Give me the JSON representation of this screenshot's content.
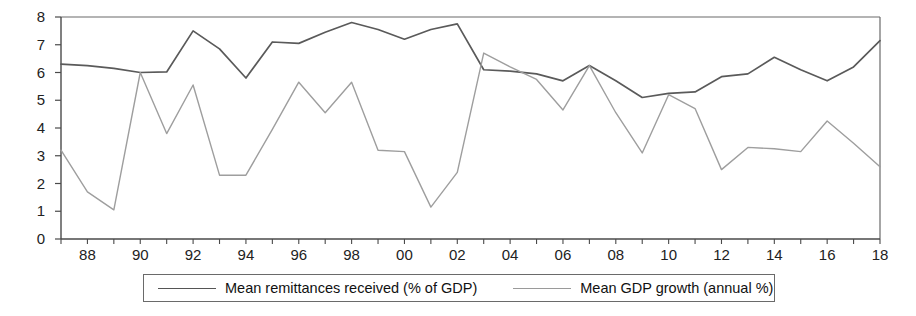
{
  "chart_data": {
    "type": "line",
    "title": "",
    "subtitle": "",
    "xlabel": "",
    "ylabel": "",
    "xlim": [
      1987,
      2018
    ],
    "ylim": [
      0,
      8
    ],
    "grid": false,
    "legend_position": "bottom",
    "x": [
      1987,
      1988,
      1989,
      1990,
      1991,
      1992,
      1993,
      1994,
      1995,
      1996,
      1997,
      1998,
      1999,
      2000,
      2001,
      2002,
      2003,
      2004,
      2005,
      2006,
      2007,
      2008,
      2009,
      2010,
      2011,
      2012,
      2013,
      2014,
      2015,
      2016,
      2017,
      2018
    ],
    "x_tick_labels": [
      "88",
      "90",
      "92",
      "94",
      "96",
      "98",
      "00",
      "02",
      "04",
      "06",
      "08",
      "10",
      "12",
      "14",
      "16",
      "18"
    ],
    "x_tick_values": [
      1988,
      1990,
      1992,
      1994,
      1996,
      1998,
      2000,
      2002,
      2004,
      2006,
      2008,
      2010,
      2012,
      2014,
      2016,
      2018
    ],
    "y_tick_labels": [
      "0",
      "1",
      "2",
      "3",
      "4",
      "5",
      "6",
      "7",
      "8"
    ],
    "y_tick_values": [
      0,
      1,
      2,
      3,
      4,
      5,
      6,
      7,
      8
    ],
    "series": [
      {
        "name": "Mean remittances received (% of GDP)",
        "color": "#5a5a5a",
        "values": [
          6.3,
          6.25,
          6.15,
          6.0,
          6.02,
          7.5,
          6.85,
          5.8,
          7.1,
          7.05,
          7.45,
          7.8,
          7.55,
          7.2,
          7.55,
          7.75,
          6.1,
          6.05,
          5.95,
          5.7,
          6.25,
          5.7,
          5.1,
          5.25,
          5.3,
          5.85,
          5.95,
          6.55,
          6.1,
          5.7,
          6.2,
          7.15
        ]
      },
      {
        "name": "Mean GDP growth (annual %)",
        "color": "#9e9e9e",
        "values": [
          3.2,
          1.7,
          1.05,
          6.0,
          3.8,
          5.55,
          2.3,
          2.3,
          3.95,
          5.65,
          4.55,
          5.65,
          3.2,
          3.15,
          1.15,
          2.4,
          6.7,
          6.2,
          5.75,
          4.65,
          6.25,
          4.55,
          3.1,
          5.2,
          4.7,
          2.5,
          3.3,
          3.25,
          3.15,
          4.25,
          3.45,
          2.6
        ]
      }
    ]
  },
  "legend": {
    "items": [
      {
        "label": "Mean remittances received (% of GDP)"
      },
      {
        "label": "Mean GDP growth (annual %)"
      }
    ]
  },
  "axes": {
    "y_labels": [
      "8",
      "7",
      "6",
      "5",
      "4",
      "3",
      "2",
      "1",
      "0"
    ],
    "x_labels": [
      "88",
      "90",
      "92",
      "94",
      "96",
      "98",
      "00",
      "02",
      "04",
      "06",
      "08",
      "10",
      "12",
      "14",
      "16",
      "18"
    ]
  },
  "colors": {
    "series_remittances": "#5a5a5a",
    "series_gdp": "#9e9e9e",
    "axis": "#4a4a4a",
    "frame": "#6a6a6a",
    "background": "#ffffff"
  }
}
